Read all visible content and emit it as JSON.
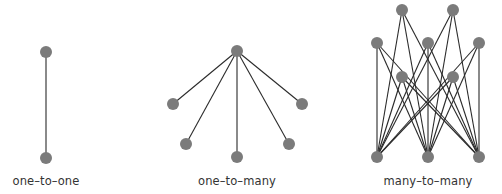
{
  "colors": {
    "node": "#7b7b7b",
    "edge": "#2a2a2a",
    "label": "#333333"
  },
  "diagrams": [
    {
      "label": "one–to–one",
      "label_x": 46,
      "nodes": [
        [
          46,
          52
        ],
        [
          46,
          158
        ]
      ],
      "edges": [
        [
          0,
          1
        ]
      ]
    },
    {
      "label": "one–to–many",
      "label_x": 237,
      "nodes": [
        [
          237,
          51
        ],
        [
          173,
          104
        ],
        [
          302,
          104
        ],
        [
          186,
          144
        ],
        [
          289,
          144
        ],
        [
          237,
          157
        ]
      ],
      "edges": [
        [
          0,
          1
        ],
        [
          0,
          2
        ],
        [
          0,
          3
        ],
        [
          0,
          4
        ],
        [
          0,
          5
        ]
      ]
    },
    {
      "label": "many–to–many",
      "label_x": 428,
      "nodes": [
        [
          402,
          10
        ],
        [
          453,
          10
        ],
        [
          377,
          43
        ],
        [
          428,
          43
        ],
        [
          479,
          43
        ],
        [
          402,
          77
        ],
        [
          453,
          77
        ],
        [
          377,
          157
        ],
        [
          428,
          157
        ],
        [
          479,
          157
        ]
      ],
      "edges": [
        [
          0,
          7
        ],
        [
          0,
          8
        ],
        [
          0,
          9
        ],
        [
          1,
          7
        ],
        [
          1,
          8
        ],
        [
          1,
          9
        ],
        [
          2,
          7
        ],
        [
          2,
          8
        ],
        [
          2,
          9
        ],
        [
          3,
          7
        ],
        [
          3,
          8
        ],
        [
          3,
          9
        ],
        [
          4,
          7
        ],
        [
          4,
          8
        ],
        [
          4,
          9
        ],
        [
          5,
          7
        ],
        [
          5,
          8
        ],
        [
          5,
          9
        ],
        [
          6,
          7
        ],
        [
          6,
          8
        ],
        [
          6,
          9
        ]
      ]
    }
  ]
}
